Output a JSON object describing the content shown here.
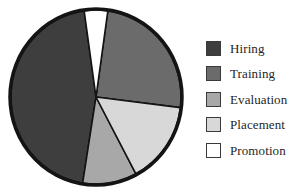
{
  "chart_data": {
    "type": "pie",
    "title": "",
    "subtitle": "",
    "xlabel": "",
    "ylabel": "",
    "grid": false,
    "legend_position": "right",
    "start_angle_deg": 8,
    "direction": "clockwise",
    "categories": [
      "Hiring",
      "Training",
      "Evaluation",
      "Placement",
      "Promotion"
    ],
    "values": [
      45,
      25,
      10,
      15,
      5
    ],
    "slices": [
      {
        "label": "Hiring",
        "value": 45,
        "color": "#3e3e3e",
        "start_deg": 189,
        "end_deg": 352
      },
      {
        "label": "Training",
        "value": 25,
        "color": "#6b6b6b",
        "start_deg": 8,
        "end_deg": 97
      },
      {
        "label": "Evaluation",
        "value": 10,
        "color": "#a8a8a8",
        "start_deg": 152,
        "end_deg": 189
      },
      {
        "label": "Placement",
        "value": 15,
        "color": "#d8d8d8",
        "start_deg": 97,
        "end_deg": 152
      },
      {
        "label": "Promotion",
        "value": 5,
        "color": "#ffffff",
        "start_deg": 352,
        "end_deg": 8
      }
    ]
  },
  "legend": {
    "items": [
      {
        "label": "Hiring",
        "color": "#3e3e3e"
      },
      {
        "label": "Training",
        "color": "#6b6b6b"
      },
      {
        "label": "Evaluation",
        "color": "#a8a8a8"
      },
      {
        "label": "Placement",
        "color": "#d8d8d8"
      },
      {
        "label": "Promotion",
        "color": "#ffffff"
      }
    ]
  },
  "style": {
    "pie_outline_color": "#141414",
    "slice_divider_color": "#141414",
    "background": "#ffffff",
    "text_color": "#262626"
  }
}
